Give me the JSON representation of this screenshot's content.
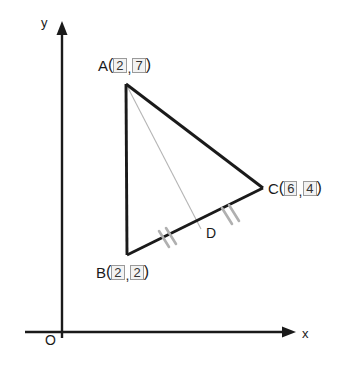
{
  "figure": {
    "type": "geometry-diagram",
    "axes": {
      "x_label": "x",
      "y_label": "y",
      "origin_label": "O"
    },
    "points": [
      {
        "id": "A",
        "name": "A",
        "open_paren": "(",
        "x_value": "2",
        "comma": ",",
        "y_value": "7",
        "close_paren": ")",
        "px": 126,
        "py": 84
      },
      {
        "id": "B",
        "name": "B",
        "open_paren": "(",
        "x_value": "2",
        "comma": ",",
        "y_value": "2",
        "close_paren": ")",
        "px": 127,
        "py": 255
      },
      {
        "id": "C",
        "name": "C",
        "open_paren": "(",
        "x_value": "6",
        "comma": ",",
        "y_value": "4",
        "close_paren": ")",
        "px": 263,
        "py": 188
      }
    ],
    "midpoint": {
      "id": "D",
      "name": "D",
      "px": 201,
      "py": 229
    },
    "tick_marks": {
      "segments": [
        "BD",
        "DC"
      ],
      "strokes_per_segment": 2,
      "color": "#b0b0b0"
    },
    "colors": {
      "triangle_stroke": "#1a1a1a",
      "median_stroke": "#b5b5b5",
      "axis_stroke": "#1a1a1a",
      "numbox_fill": "#f2f2f2",
      "numbox_border": "#9a9a9a",
      "background": "#ffffff"
    }
  }
}
